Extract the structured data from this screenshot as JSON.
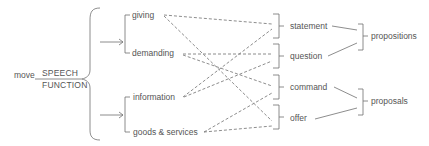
{
  "diagram": {
    "root": {
      "label": "move",
      "system_top": "SPEECH",
      "system_bottom": "FUNCTION"
    },
    "role_system": {
      "options": [
        "giving",
        "demanding"
      ]
    },
    "commodity_system": {
      "options": [
        "information",
        "goods & services"
      ]
    },
    "speech_functions": [
      "statement",
      "question",
      "command",
      "offer"
    ],
    "groupings": [
      {
        "label": "propositions",
        "members": [
          "statement",
          "question"
        ]
      },
      {
        "label": "proposals",
        "members": [
          "command",
          "offer"
        ]
      }
    ],
    "connections": [
      {
        "from": "giving",
        "to": "statement"
      },
      {
        "from": "giving",
        "to": "offer"
      },
      {
        "from": "demanding",
        "to": "question"
      },
      {
        "from": "demanding",
        "to": "command"
      },
      {
        "from": "information",
        "to": "statement"
      },
      {
        "from": "information",
        "to": "question"
      },
      {
        "from": "goods & services",
        "to": "command"
      },
      {
        "from": "goods & services",
        "to": "offer"
      }
    ],
    "colors": {
      "line": "#707070",
      "text": "#555555"
    }
  }
}
